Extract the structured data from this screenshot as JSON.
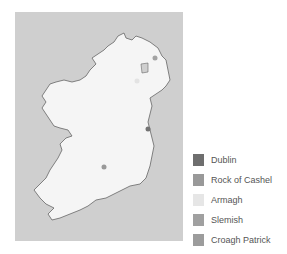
{
  "map": {
    "region": "Ireland",
    "sea_color": "#cfcfcf",
    "land_color": "#f5f5f5",
    "coast_color": "#666666",
    "points": [
      {
        "name": "Dublin",
        "x": 148,
        "y": 129,
        "color": "#737373"
      },
      {
        "name": "Rock of Cashel",
        "x": 104,
        "y": 167,
        "color": "#999999"
      },
      {
        "name": "Armagh",
        "x": 137,
        "y": 81,
        "color": "#e3e3e3"
      },
      {
        "name": "Slemish",
        "x": 155,
        "y": 58,
        "color": "#a3a3a3"
      },
      {
        "name": "Croagh Patrick",
        "x": 50,
        "y": 113,
        "color": "#9a9a9a"
      }
    ]
  },
  "legend": {
    "items": [
      {
        "label": "Dublin",
        "color": "#6e6e6e"
      },
      {
        "label": "Rock of Cashel",
        "color": "#999999"
      },
      {
        "label": "Armagh",
        "color": "#e6e6e6"
      },
      {
        "label": "Slemish",
        "color": "#a0a0a0"
      },
      {
        "label": "Croagh Patrick",
        "color": "#9c9c9c"
      }
    ]
  }
}
